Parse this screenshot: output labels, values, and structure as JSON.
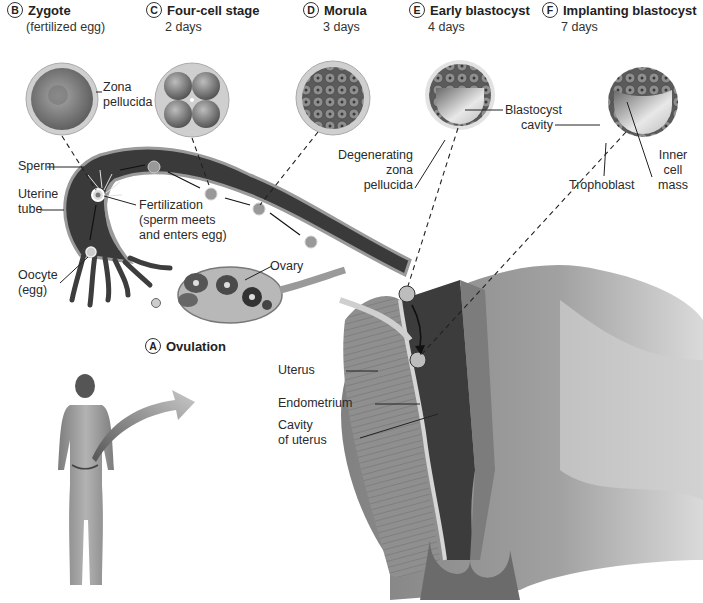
{
  "diagram": {
    "stages": [
      {
        "letter": "A",
        "title": "Ovulation",
        "subtitle": ""
      },
      {
        "letter": "B",
        "title": "Zygote",
        "subtitle": "(fertilized egg)"
      },
      {
        "letter": "C",
        "title": "Four-cell stage",
        "subtitle": "2 days"
      },
      {
        "letter": "D",
        "title": "Morula",
        "subtitle": "3 days"
      },
      {
        "letter": "E",
        "title": "Early blastocyst",
        "subtitle": "4 days"
      },
      {
        "letter": "F",
        "title": "Implanting blastocyst",
        "subtitle": "7 days"
      }
    ],
    "labels": {
      "zona_pellucida_1": "Zona",
      "zona_pellucida_2": "pellucida",
      "blastocyst_cavity_1": "Blastocyst",
      "blastocyst_cavity_2": "cavity",
      "degenerating_1": "Degenerating",
      "degenerating_2": "zona",
      "degenerating_3": "pellucida",
      "trophoblast": "Trophoblast",
      "inner_cell_mass_1": "Inner",
      "inner_cell_mass_2": "cell",
      "inner_cell_mass_3": "mass",
      "sperm": "Sperm",
      "uterine_tube_1": "Uterine",
      "uterine_tube_2": "tube",
      "fertilization_1": "Fertilization",
      "fertilization_2": "(sperm meets",
      "fertilization_3": "and enters egg)",
      "oocyte_1": "Oocyte",
      "oocyte_2": "(egg)",
      "ovary": "Ovary",
      "uterus": "Uterus",
      "endometrium": "Endometrium",
      "cavity_1": "Cavity",
      "cavity_2": "of uterus"
    },
    "colors": {
      "background": "#ffffff",
      "tube_dark": "#3a3a3a",
      "tube_wall": "#9a9a9a",
      "tissue": "#8c8c8c",
      "label_text": "#2a2a2a",
      "leader_line": "#222222"
    }
  }
}
